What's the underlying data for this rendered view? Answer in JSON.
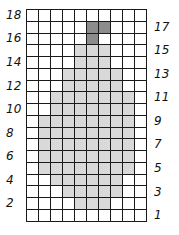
{
  "grid": {
    "columns": 10,
    "rows": 18,
    "colors": {
      "light": "#d9d9d9",
      "dark": "#8c8c8c",
      "empty": "#ffffff",
      "line": "#1a1a1a"
    },
    "filled_rows": [
      {
        "row": 18,
        "light": [],
        "dark": []
      },
      {
        "row": 17,
        "light": [],
        "dark": [
          6,
          7
        ]
      },
      {
        "row": 16,
        "light": [],
        "dark": [
          6
        ]
      },
      {
        "row": 15,
        "light": [
          5,
          6,
          7
        ],
        "dark": []
      },
      {
        "row": 14,
        "light": [
          5,
          6,
          7
        ],
        "dark": []
      },
      {
        "row": 13,
        "light": [
          4,
          5,
          6,
          7,
          8
        ],
        "dark": []
      },
      {
        "row": 12,
        "light": [
          4,
          5,
          6,
          7,
          8
        ],
        "dark": []
      },
      {
        "row": 11,
        "light": [
          3,
          4,
          5,
          6,
          7,
          8,
          9
        ],
        "dark": []
      },
      {
        "row": 10,
        "light": [
          3,
          4,
          5,
          6,
          7,
          8,
          9
        ],
        "dark": []
      },
      {
        "row": 9,
        "light": [
          2,
          3,
          4,
          5,
          6,
          7,
          8,
          9
        ],
        "dark": []
      },
      {
        "row": 8,
        "light": [
          2,
          3,
          4,
          5,
          6,
          7,
          8,
          9
        ],
        "dark": []
      },
      {
        "row": 7,
        "light": [
          2,
          3,
          4,
          5,
          6,
          7,
          8,
          9
        ],
        "dark": []
      },
      {
        "row": 6,
        "light": [
          2,
          3,
          4,
          5,
          6,
          7,
          8,
          9
        ],
        "dark": []
      },
      {
        "row": 5,
        "light": [
          2,
          3,
          4,
          5,
          6,
          7,
          8,
          9
        ],
        "dark": []
      },
      {
        "row": 4,
        "light": [
          3,
          4,
          5,
          6,
          7,
          8
        ],
        "dark": []
      },
      {
        "row": 3,
        "light": [
          4,
          5,
          6,
          7,
          8
        ],
        "dark": []
      },
      {
        "row": 2,
        "light": [
          5,
          6,
          7
        ],
        "dark": []
      },
      {
        "row": 1,
        "light": [],
        "dark": []
      }
    ]
  },
  "labels": {
    "left": [
      {
        "text": "18",
        "row": 18
      },
      {
        "text": "16",
        "row": 16
      },
      {
        "text": "14",
        "row": 14
      },
      {
        "text": "12",
        "row": 12
      },
      {
        "text": "10",
        "row": 10
      },
      {
        "text": "8",
        "row": 8
      },
      {
        "text": "6",
        "row": 6
      },
      {
        "text": "4",
        "row": 4
      },
      {
        "text": "2",
        "row": 2
      }
    ],
    "right": [
      {
        "text": "17",
        "row": 17
      },
      {
        "text": "15",
        "row": 15
      },
      {
        "text": "13",
        "row": 13
      },
      {
        "text": "11",
        "row": 11
      },
      {
        "text": "9",
        "row": 9
      },
      {
        "text": "7",
        "row": 7
      },
      {
        "text": "5",
        "row": 5
      },
      {
        "text": "3",
        "row": 3
      },
      {
        "text": "1",
        "row": 1
      }
    ]
  }
}
